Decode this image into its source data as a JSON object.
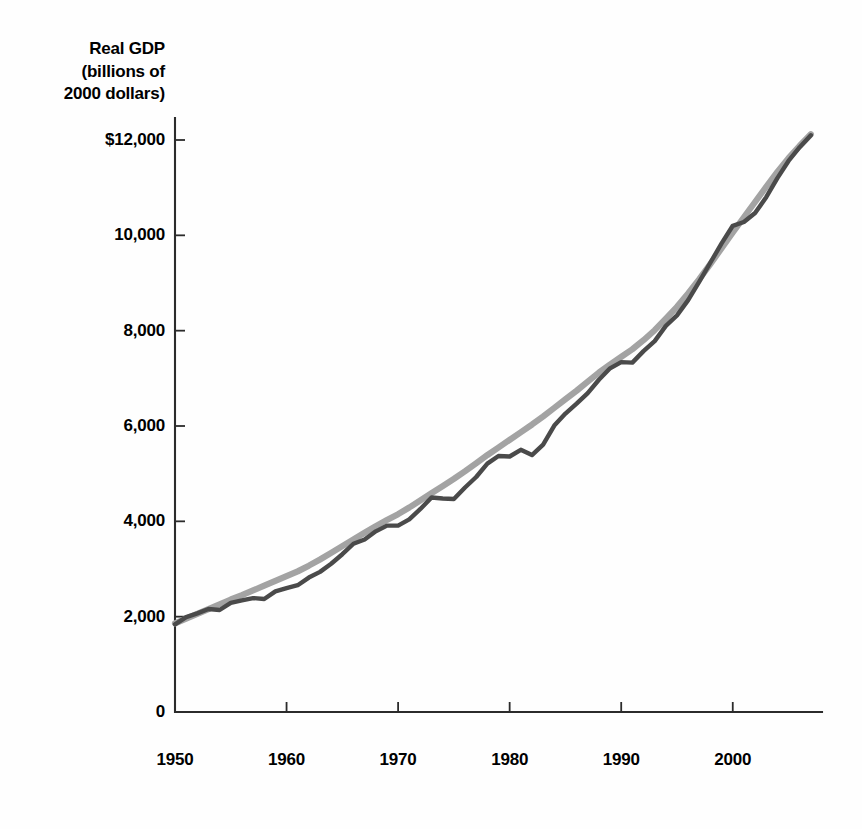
{
  "chart_data": {
    "type": "line",
    "title": "Real GDP (billions of 2000 dollars)",
    "title_lines": [
      "Real GDP",
      "(billions of",
      "2000 dollars)"
    ],
    "xlabel": "",
    "ylabel": "Real GDP (billions of 2000 dollars)",
    "xlim": [
      1950,
      2008
    ],
    "ylim": [
      0,
      12000
    ],
    "grid": false,
    "legend": "none",
    "y_ticks": [
      0,
      2000,
      4000,
      6000,
      8000,
      10000,
      12000
    ],
    "y_tick_labels": [
      "0",
      "2,000",
      "4,000",
      "6,000",
      "8,000",
      "10,000",
      "$12,000"
    ],
    "x_ticks": [
      1950,
      1960,
      1970,
      1980,
      1990,
      2000
    ],
    "x_tick_labels": [
      "1950",
      "1960",
      "1970",
      "1980",
      "1990",
      "2000"
    ],
    "colors": {
      "actual": "#4a4a4a",
      "trend": "#a3a3a3",
      "axis": "#2b2b2b",
      "background": "#fefefe",
      "text": "#000000"
    },
    "x": [
      1950,
      1951,
      1952,
      1953,
      1954,
      1955,
      1956,
      1957,
      1958,
      1959,
      1960,
      1961,
      1962,
      1963,
      1964,
      1965,
      1966,
      1967,
      1968,
      1969,
      1970,
      1971,
      1972,
      1973,
      1974,
      1975,
      1976,
      1977,
      1978,
      1979,
      1980,
      1981,
      1982,
      1983,
      1984,
      1985,
      1986,
      1987,
      1988,
      1989,
      1990,
      1991,
      1992,
      1993,
      1994,
      1995,
      1996,
      1997,
      1998,
      1999,
      2000,
      2001,
      2002,
      2003,
      2004,
      2005,
      2006,
      2007
    ],
    "series": [
      {
        "name": "Real GDP",
        "color": "#4a4a4a",
        "values": [
          1840,
          1990,
          2070,
          2160,
          2140,
          2290,
          2340,
          2390,
          2370,
          2530,
          2600,
          2660,
          2820,
          2940,
          3110,
          3310,
          3530,
          3620,
          3790,
          3910,
          3910,
          4040,
          4260,
          4500,
          4480,
          4470,
          4710,
          4930,
          5210,
          5370,
          5360,
          5500,
          5390,
          5610,
          6010,
          6260,
          6470,
          6690,
          6970,
          7210,
          7340,
          7330,
          7570,
          7780,
          8100,
          8320,
          8640,
          9030,
          9430,
          9830,
          10200,
          10280,
          10470,
          10800,
          11200,
          11560,
          11850,
          12100
        ]
      },
      {
        "name": "Trend GDP (potential output)",
        "color": "#a3a3a3",
        "values": [
          1860,
          1960,
          2060,
          2160,
          2260,
          2360,
          2450,
          2550,
          2650,
          2750,
          2850,
          2950,
          3070,
          3200,
          3340,
          3480,
          3620,
          3760,
          3900,
          4030,
          4150,
          4290,
          4440,
          4590,
          4740,
          4890,
          5050,
          5220,
          5390,
          5550,
          5710,
          5870,
          6030,
          6200,
          6380,
          6560,
          6740,
          6930,
          7120,
          7290,
          7450,
          7610,
          7800,
          8010,
          8250,
          8500,
          8780,
          9080,
          9400,
          9730,
          10060,
          10380,
          10700,
          11020,
          11330,
          11620,
          11880,
          12120
        ]
      }
    ],
    "annotations": []
  }
}
